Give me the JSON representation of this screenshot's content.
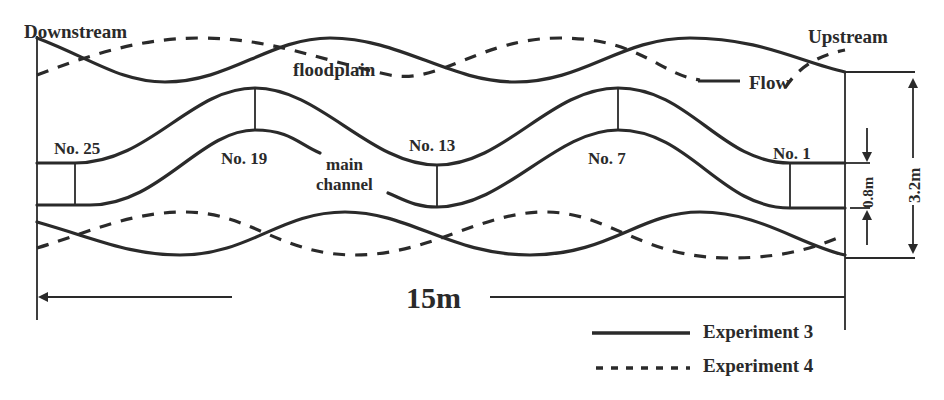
{
  "diagram": {
    "type": "meandering compound channel flume layout",
    "labels": {
      "downstream": "Downstream",
      "upstream": "Upstream",
      "floodplain": "floodplain",
      "flow": "Flow",
      "main_channel_line1": "main",
      "main_channel_line2": "channel"
    },
    "sections": [
      {
        "id": "no25",
        "label": "No. 25"
      },
      {
        "id": "no19",
        "label": "No. 19"
      },
      {
        "id": "no13",
        "label": "No. 13"
      },
      {
        "id": "no7",
        "label": "No. 7"
      },
      {
        "id": "no1",
        "label": "No. 1"
      }
    ],
    "dimensions": {
      "length": "15m",
      "total_width": "3.2m",
      "channel_width": "0.8m"
    },
    "legend": [
      {
        "style": "solid",
        "label": "Experiment 3"
      },
      {
        "style": "dashed",
        "label": "Experiment 4"
      }
    ],
    "colors": {
      "line": "#2a2a2a",
      "background": "#ffffff"
    }
  }
}
